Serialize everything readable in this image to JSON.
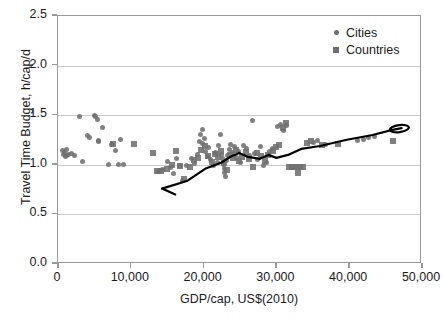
{
  "caption_remnant": "",
  "chart_data": {
    "type": "scatter",
    "title": "",
    "xlabel": "GDP/cap, US$(2010)",
    "ylabel": "Travel Time Budget, h/cap/d",
    "xlim": [
      0,
      50000
    ],
    "ylim": [
      0.0,
      2.5
    ],
    "xticks": [
      0,
      10000,
      20000,
      30000,
      40000,
      50000
    ],
    "xtick_labels": [
      "0",
      "10,000",
      "20,000",
      "30,000",
      "40,000",
      "50,000"
    ],
    "yticks": [
      0.0,
      0.5,
      1.0,
      1.5,
      2.0,
      2.5
    ],
    "ytick_labels": [
      "0.0",
      "0.5",
      "1.0",
      "1.5",
      "2.0",
      "2.5"
    ],
    "grid": "horizontal",
    "legend_position": "top-right",
    "marker_color": "#6f6f6f",
    "line_color": "#000000",
    "series": [
      {
        "name": "Cities",
        "marker": "circle",
        "points": [
          [
            600,
            1.14
          ],
          [
            700,
            1.1
          ],
          [
            900,
            1.12
          ],
          [
            1000,
            1.08
          ],
          [
            1100,
            1.15
          ],
          [
            1200,
            1.09
          ],
          [
            1500,
            1.1
          ],
          [
            1800,
            1.11
          ],
          [
            2300,
            1.09
          ],
          [
            3000,
            1.49
          ],
          [
            3300,
            1.03
          ],
          [
            4100,
            1.3
          ],
          [
            4300,
            1.28
          ],
          [
            5000,
            1.5
          ],
          [
            5200,
            1.49
          ],
          [
            5400,
            1.46
          ],
          [
            5500,
            1.25
          ],
          [
            5600,
            1.24
          ],
          [
            6100,
            1.38
          ],
          [
            6900,
            1.0
          ],
          [
            7400,
            1.21
          ],
          [
            7900,
            1.14
          ],
          [
            8300,
            1.0
          ],
          [
            8600,
            1.26
          ],
          [
            9000,
            1.0
          ],
          [
            13800,
            0.93
          ],
          [
            14300,
            0.95
          ],
          [
            15100,
            1.03
          ],
          [
            15400,
            0.97
          ],
          [
            15900,
            0.91
          ],
          [
            16300,
            1.06
          ],
          [
            16700,
            0.99
          ],
          [
            17100,
            0.84
          ],
          [
            17600,
            0.99
          ],
          [
            18300,
            1.06
          ],
          [
            18800,
            1.01
          ],
          [
            19100,
            1.1
          ],
          [
            19400,
            1.24
          ],
          [
            19600,
            1.31
          ],
          [
            19800,
            1.36
          ],
          [
            19900,
            1.22
          ],
          [
            20100,
            1.27
          ],
          [
            20300,
            1.13
          ],
          [
            20500,
            1.08
          ],
          [
            20700,
            1.17
          ],
          [
            21000,
            1.05
          ],
          [
            21300,
            0.99
          ],
          [
            21600,
            1.12
          ],
          [
            21900,
            1.02
          ],
          [
            22100,
            1.2
          ],
          [
            22300,
            1.31
          ],
          [
            22500,
            1.1
          ],
          [
            22600,
            1.06
          ],
          [
            22700,
            1.0
          ],
          [
            22800,
            0.96
          ],
          [
            22900,
            0.92
          ],
          [
            23000,
            0.88
          ],
          [
            23100,
            1.04
          ],
          [
            23300,
            1.09
          ],
          [
            23500,
            1.15
          ],
          [
            23700,
            1.21
          ],
          [
            23900,
            1.12
          ],
          [
            24200,
            1.18
          ],
          [
            24500,
            1.07
          ],
          [
            24800,
            1.13
          ],
          [
            25100,
            1.02
          ],
          [
            25500,
            1.2
          ],
          [
            25900,
            1.16
          ],
          [
            26300,
            1.09
          ],
          [
            26700,
            1.45
          ],
          [
            27000,
            1.11
          ],
          [
            27400,
            1.05
          ],
          [
            27800,
            1.19
          ],
          [
            28200,
            0.99
          ],
          [
            28600,
            1.02
          ],
          [
            29000,
            1.13
          ],
          [
            29400,
            1.16
          ],
          [
            30200,
            1.39
          ],
          [
            30600,
            1.41
          ],
          [
            31000,
            1.35
          ],
          [
            31400,
            1.4
          ],
          [
            35100,
            1.23
          ],
          [
            35600,
            1.25
          ],
          [
            36800,
            1.21
          ],
          [
            41200,
            1.25
          ],
          [
            41900,
            1.26
          ],
          [
            42700,
            1.28
          ],
          [
            43400,
            1.29
          ]
        ]
      },
      {
        "name": "Countries",
        "marker": "square",
        "points": [
          [
            7600,
            1.21
          ],
          [
            10500,
            1.21
          ],
          [
            13100,
            1.12
          ],
          [
            13600,
            0.94
          ],
          [
            14200,
            0.94
          ],
          [
            14900,
            0.96
          ],
          [
            15600,
            1.0
          ],
          [
            16200,
            1.14
          ],
          [
            16800,
            0.99
          ],
          [
            17300,
            0.86
          ],
          [
            18100,
            0.98
          ],
          [
            18700,
            1.05
          ],
          [
            19200,
            1.07
          ],
          [
            19700,
            1.15
          ],
          [
            20200,
            1.19
          ],
          [
            20600,
            1.09
          ],
          [
            21100,
            1.03
          ],
          [
            21500,
            1.11
          ],
          [
            22000,
            1.08
          ],
          [
            22400,
            1.14
          ],
          [
            22800,
            1.02
          ],
          [
            23200,
            0.95
          ],
          [
            23600,
            1.1
          ],
          [
            24000,
            1.07
          ],
          [
            24400,
            1.15
          ],
          [
            24900,
            1.04
          ],
          [
            25300,
            1.08
          ],
          [
            25800,
            1.13
          ],
          [
            26200,
            1.06
          ],
          [
            26800,
            0.98
          ],
          [
            27300,
            1.12
          ],
          [
            27900,
            1.09
          ],
          [
            28400,
            1.04
          ],
          [
            28900,
            1.1
          ],
          [
            29500,
            1.14
          ],
          [
            29900,
            1.18
          ],
          [
            30400,
            1.2
          ],
          [
            30900,
            1.37
          ],
          [
            31300,
            1.42
          ],
          [
            31700,
            0.98
          ],
          [
            32100,
            0.98
          ],
          [
            32500,
            0.98
          ],
          [
            32900,
            0.98
          ],
          [
            33300,
            0.98
          ],
          [
            33700,
            0.98
          ],
          [
            33000,
            0.92
          ],
          [
            34200,
            1.22
          ],
          [
            34800,
            1.24
          ],
          [
            36300,
            1.2
          ],
          [
            38500,
            1.21
          ],
          [
            46000,
            1.24
          ]
        ]
      }
    ],
    "trend_line": {
      "description": "hand-drawn time-series trajectory with V-shaped start and closed loop at right end",
      "segments": [
        [
          [
            14300,
            0.76
          ],
          [
            16100,
            0.7
          ]
        ],
        [
          [
            14300,
            0.76
          ],
          [
            17800,
            0.84
          ],
          [
            20200,
            0.96
          ],
          [
            22400,
            1.02
          ],
          [
            23900,
            1.09
          ],
          [
            24900,
            1.12
          ],
          [
            26100,
            1.08
          ],
          [
            27700,
            1.06
          ]
        ],
        [
          [
            27700,
            1.06
          ],
          [
            28900,
            1.1
          ],
          [
            30000,
            1.07
          ],
          [
            31600,
            1.1
          ],
          [
            33400,
            1.16
          ],
          [
            36000,
            1.19
          ],
          [
            39500,
            1.25
          ],
          [
            43200,
            1.3
          ],
          [
            45800,
            1.35
          ],
          [
            47200,
            1.37
          ]
        ]
      ],
      "loop": {
        "cx": 46900,
        "cy": 1.365,
        "rx": 1300,
        "ry": 0.035
      }
    }
  },
  "legend": {
    "items": [
      {
        "label": "Cities",
        "marker": "circle"
      },
      {
        "label": "Countries",
        "marker": "square"
      }
    ]
  }
}
